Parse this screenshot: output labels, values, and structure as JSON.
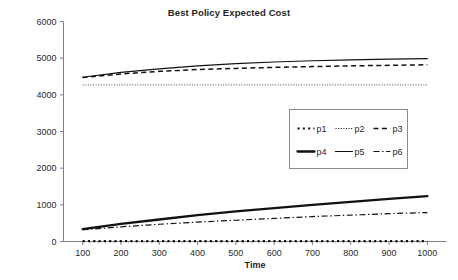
{
  "chart_data": {
    "type": "line",
    "title": "Best Policy Expected Cost",
    "xlabel": "Time",
    "ylabel": "",
    "xlim": [
      50,
      1050
    ],
    "ylim": [
      0,
      6000
    ],
    "grid": false,
    "legend_position": "center-right",
    "x": [
      100,
      200,
      300,
      400,
      500,
      600,
      700,
      800,
      900,
      1000
    ],
    "xticks": [
      "100",
      "200",
      "300",
      "400",
      "500",
      "600",
      "700",
      "800",
      "900",
      "1000"
    ],
    "yticks": [
      "0",
      "1000",
      "2000",
      "3000",
      "4000",
      "5000",
      "6000"
    ],
    "series": [
      {
        "name": "p1",
        "style": "dotted-thick",
        "color": "#111111",
        "values": [
          10,
          10,
          10,
          10,
          10,
          10,
          10,
          10,
          10,
          10
        ]
      },
      {
        "name": "p2",
        "style": "dotted-fine",
        "color": "#555555",
        "values": [
          4270,
          4270,
          4270,
          4270,
          4270,
          4270,
          4270,
          4270,
          4270,
          4270
        ]
      },
      {
        "name": "p3",
        "style": "dashed",
        "color": "#111111",
        "values": [
          4470,
          4570,
          4640,
          4690,
          4720,
          4750,
          4770,
          4790,
          4805,
          4820
        ]
      },
      {
        "name": "p4",
        "style": "solid-thick",
        "color": "#111111",
        "values": [
          340,
          480,
          600,
          720,
          820,
          910,
          1000,
          1080,
          1160,
          1240
        ]
      },
      {
        "name": "p5",
        "style": "solid-thin",
        "color": "#111111",
        "values": [
          4480,
          4610,
          4710,
          4790,
          4850,
          4895,
          4930,
          4955,
          4975,
          4990
        ]
      },
      {
        "name": "p6",
        "style": "dash-dot",
        "color": "#111111",
        "values": [
          320,
          400,
          470,
          530,
          580,
          630,
          680,
          720,
          760,
          790
        ]
      }
    ]
  },
  "legend": {
    "rows": [
      [
        {
          "label": "p1",
          "swatch": "dotted-thick"
        },
        {
          "label": "p2",
          "swatch": "dotted-fine"
        },
        {
          "label": "p3",
          "swatch": "dashed"
        }
      ],
      [
        {
          "label": "p4",
          "swatch": "solid-thick"
        },
        {
          "label": "p5",
          "swatch": "solid-thin"
        },
        {
          "label": "p6",
          "swatch": "dash-dot"
        }
      ]
    ]
  }
}
